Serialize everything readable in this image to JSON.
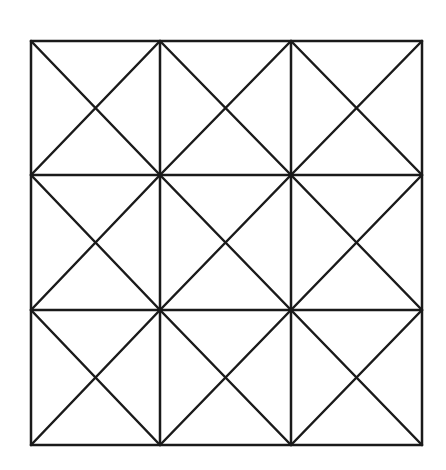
{
  "diagram": {
    "type": "grid-with-diagonals",
    "rows": 3,
    "cols": 3,
    "x_lines": [
      31,
      160,
      291,
      422
    ],
    "y_lines": [
      41,
      175,
      310,
      445
    ],
    "stroke_color": "#1a1a1a",
    "stroke_width": 2.5,
    "background": "#ffffff",
    "cells_with_both_diagonals": "all"
  }
}
